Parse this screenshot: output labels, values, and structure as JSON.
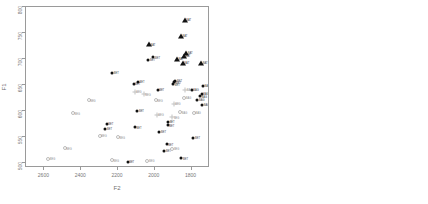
{
  "figure": {
    "type": "two-panel-scatter"
  },
  "chart_data": [
    {
      "type": "scatter",
      "panel": "left",
      "title": "",
      "xlabel": "F2",
      "ylabel": "F1",
      "xlim": [
        2700,
        1700
      ],
      "ylim": [
        800,
        490
      ],
      "x_reversed": true,
      "y_reversed": true,
      "xticks": [
        2600,
        2400,
        2200,
        2000,
        1800
      ],
      "yticks": [
        500,
        550,
        600,
        650,
        700,
        750,
        800
      ],
      "grid": false,
      "legend": "none",
      "note": "individual tokens, small labels beside each point",
      "points": [
        {
          "label": "BEG",
          "x": 2580,
          "y": 508,
          "marker": "open-circle",
          "shade": "light"
        },
        {
          "label": "BEG",
          "x": 2490,
          "y": 528,
          "marker": "open-circle",
          "shade": "light"
        },
        {
          "label": "BEG",
          "x": 2445,
          "y": 595,
          "marker": "open-circle",
          "shade": "light"
        },
        {
          "label": "BEG",
          "x": 2360,
          "y": 620,
          "marker": "open-circle",
          "shade": "light"
        },
        {
          "label": "BEG",
          "x": 2300,
          "y": 552,
          "marker": "open-circle",
          "shade": "light"
        },
        {
          "label": "BET",
          "x": 2268,
          "y": 566,
          "marker": "dot",
          "shade": "dark"
        },
        {
          "label": "BET",
          "x": 2262,
          "y": 575,
          "marker": "dot",
          "shade": "dark"
        },
        {
          "label": "BEG",
          "x": 2233,
          "y": 505,
          "marker": "open-circle",
          "shade": "light"
        },
        {
          "label": "BEG",
          "x": 2200,
          "y": 549,
          "marker": "open-circle",
          "shade": "light"
        },
        {
          "label": "BET",
          "x": 2148,
          "y": 502,
          "marker": "dot",
          "shade": "dark"
        },
        {
          "label": "BET",
          "x": 2108,
          "y": 568,
          "marker": "dot",
          "shade": "dark"
        },
        {
          "label": "BET",
          "x": 2095,
          "y": 600,
          "marker": "dot",
          "shade": "dark"
        },
        {
          "label": "BEG",
          "x": 2110,
          "y": 637,
          "marker": "plus",
          "shade": "light"
        },
        {
          "label": "BET",
          "x": 2232,
          "y": 673,
          "marker": "dot",
          "shade": "dark"
        },
        {
          "label": "BET",
          "x": 2115,
          "y": 652,
          "marker": "dot",
          "shade": "dark"
        },
        {
          "label": "BET",
          "x": 2092,
          "y": 656,
          "marker": "dot",
          "shade": "dark"
        },
        {
          "label": "BEG",
          "x": 2040,
          "y": 504,
          "marker": "open-circle",
          "shade": "light"
        },
        {
          "label": "BEG",
          "x": 1995,
          "y": 620,
          "marker": "open-circle",
          "shade": "light"
        },
        {
          "label": "BET",
          "x": 1985,
          "y": 640,
          "marker": "dot",
          "shade": "dark"
        },
        {
          "label": "BET",
          "x": 2035,
          "y": 698,
          "marker": "dot",
          "shade": "dark"
        },
        {
          "label": "BET",
          "x": 2008,
          "y": 703,
          "marker": "dot",
          "shade": "dark"
        },
        {
          "label": "BAT",
          "x": 2032,
          "y": 728,
          "marker": "tri",
          "shade": "dark"
        },
        {
          "label": "BET",
          "x": 1948,
          "y": 523,
          "marker": "dot",
          "shade": "dark"
        },
        {
          "label": "BET",
          "x": 1935,
          "y": 536,
          "marker": "dot",
          "shade": "dark"
        },
        {
          "label": "BEG",
          "x": 1905,
          "y": 527,
          "marker": "open-circle",
          "shade": "light"
        },
        {
          "label": "BET",
          "x": 1930,
          "y": 572,
          "marker": "dot",
          "shade": "dark"
        },
        {
          "label": "BET",
          "x": 1928,
          "y": 579,
          "marker": "dot",
          "shade": "dark"
        },
        {
          "label": "BEG",
          "x": 1905,
          "y": 588,
          "marker": "plus",
          "shade": "light"
        },
        {
          "label": "BEG",
          "x": 1898,
          "y": 614,
          "marker": "plus",
          "shade": "light"
        },
        {
          "label": "BET",
          "x": 1900,
          "y": 651,
          "marker": "dot",
          "shade": "dark"
        },
        {
          "label": "BET",
          "x": 1893,
          "y": 655,
          "marker": "dot",
          "shade": "dark"
        },
        {
          "label": "BET",
          "x": 1888,
          "y": 658,
          "marker": "dot",
          "shade": "dark"
        },
        {
          "label": "BAT",
          "x": 1880,
          "y": 700,
          "marker": "tri",
          "shade": "dark"
        },
        {
          "label": "BAG",
          "x": 1862,
          "y": 597,
          "marker": "open-circle",
          "shade": "light"
        },
        {
          "label": "BET",
          "x": 1855,
          "y": 509,
          "marker": "dot",
          "shade": "dark"
        },
        {
          "label": "BAG",
          "x": 1840,
          "y": 625,
          "marker": "open-circle",
          "shade": "light"
        },
        {
          "label": "BAG",
          "x": 1835,
          "y": 641,
          "marker": "plus",
          "shade": "light"
        },
        {
          "label": "BAT",
          "x": 1848,
          "y": 692,
          "marker": "tri",
          "shade": "dark"
        },
        {
          "label": "BAT",
          "x": 1842,
          "y": 706,
          "marker": "tri",
          "shade": "dark"
        },
        {
          "label": "BAT",
          "x": 1830,
          "y": 712,
          "marker": "tri",
          "shade": "dark"
        },
        {
          "label": "BAT",
          "x": 1858,
          "y": 745,
          "marker": "tri",
          "shade": "dark"
        },
        {
          "label": "BAT",
          "x": 1838,
          "y": 775,
          "marker": "tri",
          "shade": "dark"
        },
        {
          "label": "BAG",
          "x": 1800,
          "y": 641,
          "marker": "dot",
          "shade": "dark"
        },
        {
          "label": "BAG",
          "x": 1788,
          "y": 596,
          "marker": "open-circle",
          "shade": "light"
        },
        {
          "label": "BET",
          "x": 1790,
          "y": 548,
          "marker": "dot",
          "shade": "dark"
        },
        {
          "label": "BAG",
          "x": 1768,
          "y": 621,
          "marker": "dot",
          "shade": "dark"
        },
        {
          "label": "BAG",
          "x": 1755,
          "y": 628,
          "marker": "dot",
          "shade": "dark"
        },
        {
          "label": "BAG",
          "x": 1745,
          "y": 633,
          "marker": "dot",
          "shade": "dark"
        },
        {
          "label": "BAG",
          "x": 1738,
          "y": 648,
          "marker": "dot",
          "shade": "dark"
        },
        {
          "label": "BAG",
          "x": 1742,
          "y": 612,
          "marker": "dot",
          "shade": "dark"
        },
        {
          "label": "BAT",
          "x": 1748,
          "y": 692,
          "marker": "tri",
          "shade": "dark"
        },
        {
          "label": "BEG",
          "x": 2060,
          "y": 632,
          "marker": "plus",
          "shade": "light"
        },
        {
          "label": "BEG",
          "x": 1990,
          "y": 592,
          "marker": "plus",
          "shade": "light"
        },
        {
          "label": "BET",
          "x": 1975,
          "y": 560,
          "marker": "dot",
          "shade": "dark"
        }
      ]
    },
    {
      "type": "scatter",
      "panel": "right",
      "title": "",
      "xlabel": "F2",
      "ylabel": "F1",
      "xlim": [
        2380,
        1780
      ],
      "ylim": [
        692,
        552
      ],
      "x_reversed": true,
      "y_reversed": true,
      "xticks": [
        2300,
        2200,
        2100,
        2000,
        1900,
        1800
      ],
      "yticks": [
        560,
        580,
        600,
        620,
        640,
        660,
        680
      ],
      "grid": false,
      "legend": "none",
      "note": "group means, labelled beside each marker",
      "points": [
        {
          "label": "BEG",
          "x": 2288,
          "y": 570,
          "marker": "open-square",
          "shade": "light"
        },
        {
          "label": "BET",
          "x": 2018,
          "y": 630,
          "marker": "dot",
          "shade": "dark"
        },
        {
          "label": "BAG",
          "x": 1903,
          "y": 620,
          "marker": "plus",
          "shade": "light"
        },
        {
          "label": "BAT",
          "x": 1833,
          "y": 679,
          "marker": "tri",
          "shade": "dark"
        }
      ]
    }
  ]
}
